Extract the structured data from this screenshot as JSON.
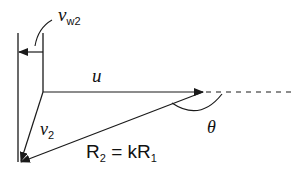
{
  "diagram": {
    "type": "velocity-triangle",
    "colors": {
      "line": "#1a1a1a",
      "background": "#ffffff"
    },
    "labels": {
      "vw2": {
        "main": "v",
        "sub": "w2"
      },
      "u": {
        "main": "u"
      },
      "v2": {
        "main": "v",
        "sub": "2"
      },
      "theta": {
        "main": "θ"
      },
      "r2": {
        "main": "R",
        "sub": "2",
        "eq": "= k",
        "main2": "R",
        "sub2": "1"
      }
    },
    "vectors": [
      {
        "name": "u",
        "from": [
          43,
          92
        ],
        "to": [
          203,
          92
        ],
        "style": "solid"
      },
      {
        "name": "extension",
        "from": [
          203,
          92
        ],
        "to": [
          292,
          92
        ],
        "style": "dashed"
      },
      {
        "name": "v2",
        "from": [
          43,
          92
        ],
        "to": [
          20,
          163
        ],
        "style": "solid"
      },
      {
        "name": "R2",
        "from": [
          203,
          92
        ],
        "to": [
          20,
          163
        ],
        "style": "solid"
      },
      {
        "name": "vw2",
        "from": [
          43,
          52
        ],
        "to": [
          18,
          52
        ],
        "style": "solid"
      }
    ]
  }
}
